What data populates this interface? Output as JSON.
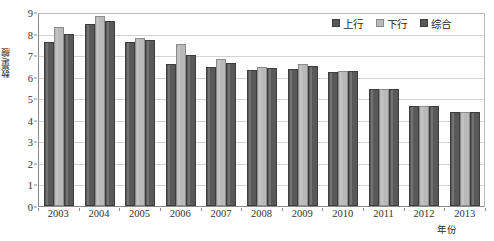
{
  "chart_data": {
    "type": "bar",
    "title": "",
    "xlabel": "年份",
    "ylabel": "数量/艘",
    "categories": [
      "2003",
      "2004",
      "2005",
      "2006",
      "2007",
      "2008",
      "2009",
      "2010",
      "2011",
      "2012",
      "2013"
    ],
    "series": [
      {
        "name": "上行",
        "color": "#595959",
        "values": [
          7.6,
          8.45,
          7.6,
          6.6,
          6.45,
          6.3,
          6.35,
          6.2,
          5.45,
          4.65,
          4.35
        ]
      },
      {
        "name": "下行",
        "color": "#b9b9b9",
        "values": [
          8.3,
          8.8,
          7.8,
          7.5,
          6.8,
          6.45,
          6.6,
          6.25,
          5.45,
          4.65,
          4.35
        ]
      },
      {
        "name": "综合",
        "color": "#595959",
        "values": [
          8.0,
          8.6,
          7.7,
          7.0,
          6.65,
          6.4,
          6.5,
          6.25,
          5.45,
          4.65,
          4.35
        ]
      }
    ],
    "ylim": [
      0,
      9
    ],
    "yticks": [
      0,
      1,
      2,
      3,
      4,
      5,
      6,
      7,
      8,
      9
    ],
    "ytick_labels": [
      "0",
      "1",
      "2",
      "3",
      "4",
      "5",
      "6",
      "7",
      "8",
      "9"
    ],
    "grid": true,
    "grid_axis": "y",
    "legend_position": "top-right",
    "legend": [
      "上行",
      "下行",
      "综合"
    ]
  }
}
